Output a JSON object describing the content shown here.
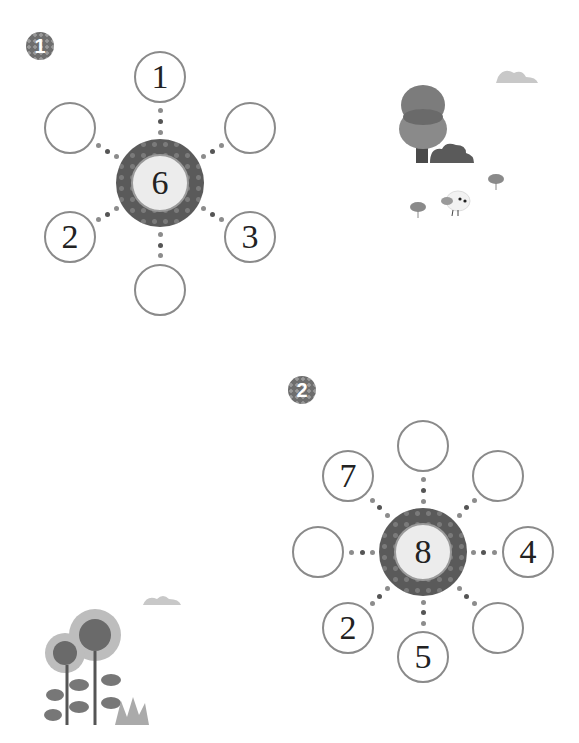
{
  "problems": [
    {
      "badge": "1",
      "center": "6",
      "spokes": [
        "1",
        "",
        "3",
        "",
        "2",
        ""
      ],
      "spoke_positions": [
        "top",
        "upper-right",
        "lower-right",
        "bottom",
        "lower-left",
        "upper-left"
      ]
    },
    {
      "badge": "2",
      "center": "8",
      "spokes": [
        "",
        "",
        "4",
        "",
        "5",
        "2",
        "",
        "7"
      ],
      "spoke_positions": [
        "top",
        "upper-right",
        "right",
        "lower-right",
        "bottom",
        "lower-left",
        "left",
        "upper-left"
      ]
    }
  ],
  "decorations": [
    "tree-bush-bird-illustration",
    "cloud",
    "sunflowers-illustration",
    "cloud"
  ],
  "colors": {
    "ring": "#5a5a5a",
    "node_border": "#8a8a8a",
    "hub_fill": "#ececec"
  }
}
